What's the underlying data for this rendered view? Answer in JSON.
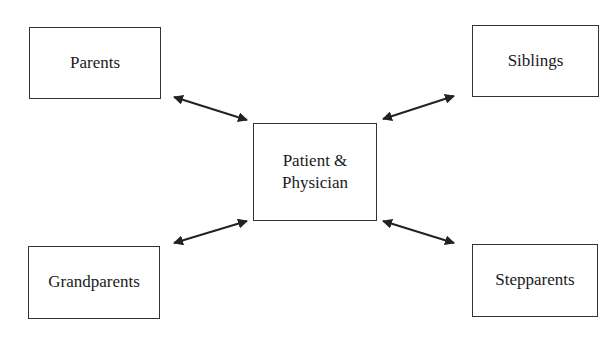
{
  "diagram": {
    "type": "hub-and-spoke",
    "center": {
      "label": "Patient &\nPhysician"
    },
    "nodes": [
      {
        "id": "parents",
        "label": "Parents"
      },
      {
        "id": "siblings",
        "label": "Siblings"
      },
      {
        "id": "grandparents",
        "label": "Grandparents"
      },
      {
        "id": "stepparents",
        "label": "Stepparents"
      }
    ],
    "edges": [
      {
        "from": "parents",
        "to": "center",
        "direction": "bidirectional"
      },
      {
        "from": "siblings",
        "to": "center",
        "direction": "bidirectional"
      },
      {
        "from": "grandparents",
        "to": "center",
        "direction": "bidirectional"
      },
      {
        "from": "stepparents",
        "to": "center",
        "direction": "bidirectional"
      }
    ],
    "colors": {
      "stroke": "#222222",
      "background": "#ffffff",
      "text": "#1a1a1a"
    }
  }
}
